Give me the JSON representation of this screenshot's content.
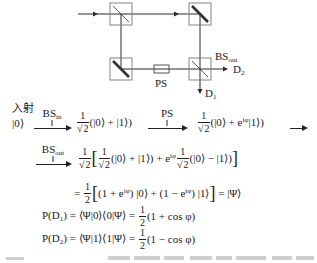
{
  "diagram": {
    "labels": {
      "bs_out": "BS",
      "bs_out_sub": "out",
      "ps": "PS",
      "d1": "D",
      "d1_sub": "1",
      "d2": "D",
      "d2_sub": "2"
    }
  },
  "derivation": {
    "row1": {
      "incident_label": "入射",
      "start_state": "|0⟩",
      "arrow1_label": "BS",
      "arrow1_label_sub": "in",
      "coef": {
        "num": "1",
        "den": "2"
      },
      "state1": "(|0⟩ + |1⟩)",
      "arrow2_label": "PS",
      "state2_pre": "(|0⟩ + e",
      "state2_exp": "iφ",
      "state2_post": "|1⟩)"
    },
    "row2": {
      "arrow_label": "BS",
      "arrow_label_sub": "out",
      "outer_coef": {
        "num": "1",
        "den": "2"
      },
      "open_bracket": "[",
      "inner_coef1": {
        "num": "1",
        "den": "2"
      },
      "term1": "(|0⟩ + |1⟩) + e",
      "term1_exp": "iφ",
      "inner_coef2": {
        "num": "1",
        "den": "2"
      },
      "term2": "(|0⟩ − |1⟩)",
      "close_bracket": "]"
    },
    "row3": {
      "eq": "=",
      "coef": {
        "num": "1",
        "den": "2"
      },
      "open_bracket": "[",
      "part1": "(1 + e",
      "part1_exp": "iφ",
      "part2": ") |0⟩ + (1 − e",
      "part2_exp": "iφ",
      "part3": ") |1⟩",
      "close_bracket": "]",
      "result": "= |Ψ⟩"
    },
    "row4": {
      "lhs": "P(D",
      "lhs_sub": "1",
      "mid": ") = ⟨Ψ|0⟩⟨0|Ψ⟩ =",
      "coef": {
        "num": "1",
        "den": "2"
      },
      "rhs": "(1 + cos φ)"
    },
    "row5": {
      "lhs": "P(D",
      "lhs_sub": "2",
      "mid": ") = ⟨Ψ|1⟩⟨1|Ψ⟩ =",
      "coef": {
        "num": "1",
        "den": "2"
      },
      "rhs": "(1 − cos φ)"
    }
  }
}
